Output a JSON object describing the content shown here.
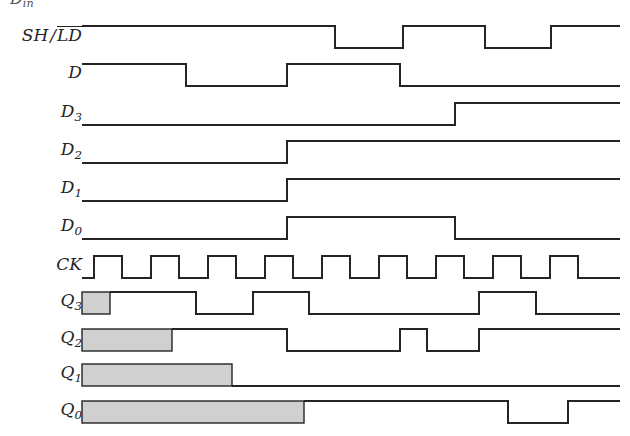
{
  "figure": {
    "kind": "digital-timing-diagram",
    "width": 630,
    "height": 436,
    "background_color": "#ffffff",
    "line_color": "#242424",
    "shade_fill_color": "#d0d0d0",
    "shade_border_color": "#242424",
    "label_color": "#242424",
    "clipped_header_text": "D",
    "clipped_header_sub": "in"
  },
  "labels": {
    "sh_ld_main": "SH",
    "sh_ld_slash": "/",
    "sh_ld_bar": "LD",
    "d": "D",
    "d3_base": "D",
    "d3_sub": "3",
    "d2_base": "D",
    "d2_sub": "2",
    "d1_base": "D",
    "d1_sub": "1",
    "d0_base": "D",
    "d0_sub": "0",
    "ck": "CK",
    "q3_base": "Q",
    "q3_sub": "3",
    "q2_base": "Q",
    "q2_sub": "2",
    "q1_base": "Q",
    "q1_sub": "1",
    "q0_base": "Q",
    "q0_sub": "0"
  },
  "chart_data": {
    "type": "line",
    "title": "",
    "xlabel": "",
    "ylabel": "",
    "x_start": 82,
    "x_end": 620,
    "high_offset": -11,
    "low_offset": 11,
    "signals": [
      {
        "name": "SH/LD",
        "label_id": "sh-ld",
        "baseline_y": 37,
        "initial": 1,
        "transitions": [
          335,
          403,
          485,
          551
        ],
        "shade": null
      },
      {
        "name": "D",
        "label_id": "d",
        "baseline_y": 75,
        "initial": 1,
        "transitions": [
          186,
          287,
          400
        ],
        "shade": null
      },
      {
        "name": "D3",
        "label_id": "d3",
        "baseline_y": 114,
        "initial": 0,
        "transitions": [
          455
        ],
        "shade": null
      },
      {
        "name": "D2",
        "label_id": "d2",
        "baseline_y": 152,
        "initial": 0,
        "transitions": [
          287
        ],
        "shade": null
      },
      {
        "name": "D1",
        "label_id": "d1",
        "baseline_y": 190,
        "initial": 0,
        "transitions": [
          287
        ],
        "shade": null
      },
      {
        "name": "D0",
        "label_id": "d0",
        "baseline_y": 228,
        "initial": 0,
        "transitions": [
          287,
          455
        ],
        "shade": null
      },
      {
        "name": "CK",
        "label_id": "ck",
        "baseline_y": 267,
        "initial": 0,
        "transitions": [
          94,
          122,
          151,
          179,
          208,
          236,
          265,
          293,
          322,
          350,
          379,
          407,
          436,
          464,
          493,
          521,
          550,
          578
        ],
        "shade": null
      },
      {
        "name": "Q3",
        "label_id": "q3",
        "baseline_y": 303,
        "initial": 1,
        "transitions": [
          196,
          253,
          309,
          479,
          536
        ],
        "shade": {
          "x0": 82,
          "x1": 110
        }
      },
      {
        "name": "Q2",
        "label_id": "q2",
        "baseline_y": 340,
        "initial": 1,
        "transitions": [
          287,
          400,
          427,
          479
        ],
        "shade": {
          "x0": 82,
          "x1": 172
        }
      },
      {
        "name": "Q1",
        "label_id": "q1",
        "baseline_y": 375,
        "initial": 0,
        "transitions": [],
        "shade": {
          "x0": 82,
          "x1": 232
        }
      },
      {
        "name": "Q0",
        "label_id": "q0",
        "baseline_y": 412,
        "initial": 1,
        "transitions": [
          508,
          568
        ],
        "shade": {
          "x0": 82,
          "x1": 304
        }
      }
    ]
  },
  "label_positions": {
    "sh_ld": {
      "right": 548,
      "top": 26,
      "size": 17
    },
    "d": {
      "right": 548,
      "top": 64,
      "size": 17
    },
    "d3": {
      "right": 548,
      "top": 103,
      "size": 17
    },
    "d2": {
      "right": 548,
      "top": 141,
      "size": 17
    },
    "d1": {
      "right": 548,
      "top": 179,
      "size": 17
    },
    "d0": {
      "right": 548,
      "top": 217,
      "size": 17
    },
    "ck": {
      "right": 548,
      "top": 256,
      "size": 17
    },
    "q3": {
      "right": 548,
      "top": 292,
      "size": 17
    },
    "q2": {
      "right": 548,
      "top": 329,
      "size": 17
    },
    "q1": {
      "right": 548,
      "top": 364,
      "size": 17
    },
    "q0": {
      "right": 548,
      "top": 401,
      "size": 17
    }
  }
}
